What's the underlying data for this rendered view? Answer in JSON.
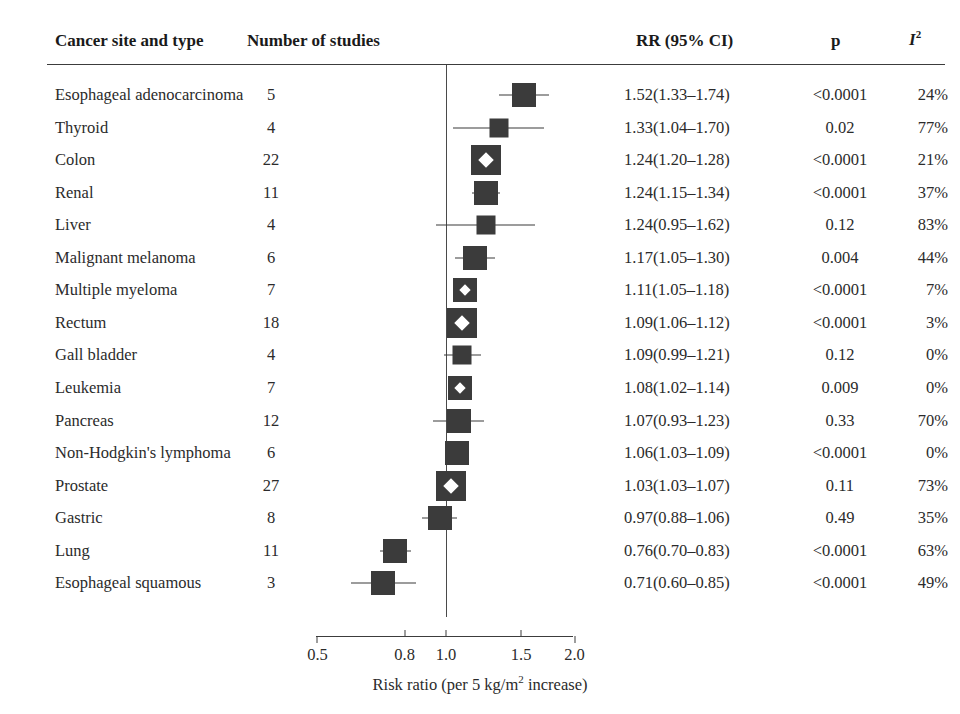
{
  "figure": {
    "type": "forest-plot",
    "headers": {
      "site": "Cancer site and type",
      "nstudies": "Number of studies",
      "rr": "RR (95% CI)",
      "p": "p",
      "i2": "I",
      "i2_sup": "2"
    },
    "axis": {
      "scale": "log",
      "ticks": [
        "0.5",
        "0.8",
        "1.0",
        "1.5",
        "2.0"
      ],
      "tick_values": [
        0.5,
        0.8,
        1.0,
        1.5,
        2.0
      ],
      "reference_line": 1.0,
      "caption_pre": "Risk ratio (per 5 kg/m",
      "caption_sup": "2",
      "caption_post": " increase)"
    },
    "colors": {
      "marker": "#3b3b3b",
      "line": "#3c3c3c",
      "text": "#2b2b2b",
      "background": "#ffffff"
    }
  },
  "chart_data": {
    "type": "forest",
    "title": "",
    "xlabel": "Risk ratio (per 5 kg/m2 increase)",
    "ylabel": "",
    "xscale": "log",
    "xlim": [
      0.5,
      2.0
    ],
    "xticks": [
      0.5,
      0.8,
      1.0,
      1.5,
      2.0
    ],
    "reference_line": 1.0,
    "columns": [
      "Cancer site and type",
      "Number of studies",
      "RR (95% CI)",
      "p",
      "I2"
    ],
    "rows": [
      {
        "label": "Esophageal adenocarcinoma",
        "n": "5",
        "rr_text": "1.52(1.33–1.74)",
        "rr": 1.52,
        "lo": 1.33,
        "hi": 1.74,
        "p": "<0.0001",
        "i2": "24%",
        "marker": "medium",
        "diamond": false
      },
      {
        "label": "Thyroid",
        "n": "4",
        "rr_text": "1.33(1.04–1.70)",
        "rr": 1.33,
        "lo": 1.04,
        "hi": 1.7,
        "p": "0.02",
        "i2": "77%",
        "marker": "small",
        "diamond": false
      },
      {
        "label": "Colon",
        "n": "22",
        "rr_text": "1.24(1.20–1.28)",
        "rr": 1.24,
        "lo": 1.2,
        "hi": 1.28,
        "p": "<0.0001",
        "i2": "21%",
        "marker": "large",
        "diamond": true
      },
      {
        "label": "Renal",
        "n": "11",
        "rr_text": "1.24(1.15–1.34)",
        "rr": 1.24,
        "lo": 1.15,
        "hi": 1.34,
        "p": "<0.0001",
        "i2": "37%",
        "marker": "medium",
        "diamond": false
      },
      {
        "label": "Liver",
        "n": "4",
        "rr_text": "1.24(0.95–1.62)",
        "rr": 1.24,
        "lo": 0.95,
        "hi": 1.62,
        "p": "0.12",
        "i2": "83%",
        "marker": "small",
        "diamond": false
      },
      {
        "label": "Malignant melanoma",
        "n": "6",
        "rr_text": "1.17(1.05–1.30)",
        "rr": 1.17,
        "lo": 1.05,
        "hi": 1.3,
        "p": "0.004",
        "i2": "44%",
        "marker": "medium",
        "diamond": false
      },
      {
        "label": "Multiple myeloma",
        "n": "7",
        "rr_text": "1.11(1.05–1.18)",
        "rr": 1.11,
        "lo": 1.05,
        "hi": 1.18,
        "p": "<0.0001",
        "i2": "7%",
        "marker": "medium",
        "diamond": true
      },
      {
        "label": "Rectum",
        "n": "18",
        "rr_text": "1.09(1.06–1.12)",
        "rr": 1.09,
        "lo": 1.06,
        "hi": 1.12,
        "p": "<0.0001",
        "i2": "3%",
        "marker": "large",
        "diamond": true
      },
      {
        "label": "Gall bladder",
        "n": "4",
        "rr_text": "1.09(0.99–1.21)",
        "rr": 1.09,
        "lo": 0.99,
        "hi": 1.21,
        "p": "0.12",
        "i2": "0%",
        "marker": "small",
        "diamond": false
      },
      {
        "label": "Leukemia",
        "n": "7",
        "rr_text": "1.08(1.02–1.14)",
        "rr": 1.08,
        "lo": 1.02,
        "hi": 1.14,
        "p": "0.009",
        "i2": "0%",
        "marker": "medium",
        "diamond": true
      },
      {
        "label": "Pancreas",
        "n": "12",
        "rr_text": "1.07(0.93–1.23)",
        "rr": 1.07,
        "lo": 0.93,
        "hi": 1.23,
        "p": "0.33",
        "i2": "70%",
        "marker": "medium",
        "diamond": false
      },
      {
        "label": "Non-Hodgkin's lymphoma",
        "n": "6",
        "rr_text": "1.06(1.03–1.09)",
        "rr": 1.06,
        "lo": 1.03,
        "hi": 1.09,
        "p": "<0.0001",
        "i2": "0%",
        "marker": "medium",
        "diamond": false
      },
      {
        "label": "Prostate",
        "n": "27",
        "rr_text": "1.03(1.03–1.07)",
        "rr": 1.03,
        "lo": 1.03,
        "hi": 1.07,
        "p": "0.11",
        "i2": "73%",
        "marker": "large",
        "diamond": true
      },
      {
        "label": "Gastric",
        "n": "8",
        "rr_text": "0.97(0.88–1.06)",
        "rr": 0.97,
        "lo": 0.88,
        "hi": 1.06,
        "p": "0.49",
        "i2": "35%",
        "marker": "medium",
        "diamond": false
      },
      {
        "label": "Lung",
        "n": "11",
        "rr_text": "0.76(0.70–0.83)",
        "rr": 0.76,
        "lo": 0.7,
        "hi": 0.83,
        "p": "<0.0001",
        "i2": "63%",
        "marker": "medium",
        "diamond": false
      },
      {
        "label": "Esophageal squamous",
        "n": "3",
        "rr_text": "0.71(0.60–0.85)",
        "rr": 0.71,
        "lo": 0.6,
        "hi": 0.85,
        "p": "<0.0001",
        "i2": "49%",
        "marker": "medium",
        "diamond": false
      }
    ]
  }
}
